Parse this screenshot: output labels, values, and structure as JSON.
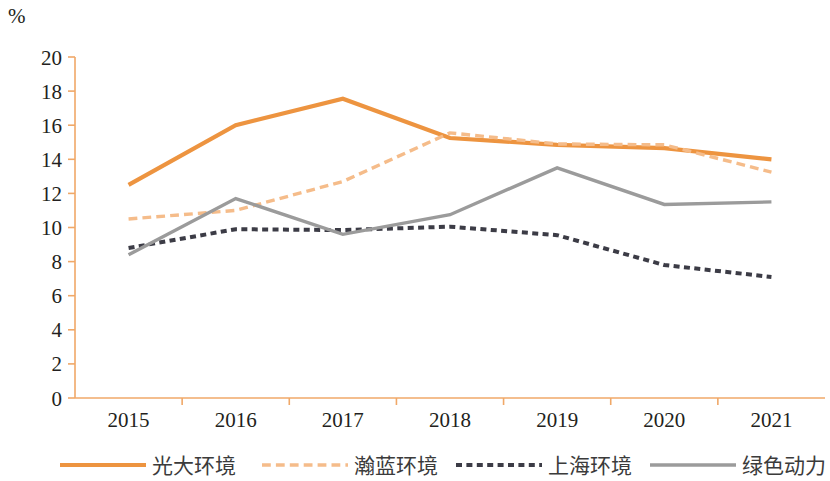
{
  "chart_data": {
    "type": "line",
    "title": "",
    "unit_label": "%",
    "xlabel": "",
    "ylabel": "%",
    "x": [
      "2015",
      "2016",
      "2017",
      "2018",
      "2019",
      "2020",
      "2021"
    ],
    "categories": [
      "2015",
      "2016",
      "2017",
      "2018",
      "2019",
      "2020",
      "2021"
    ],
    "ylim": [
      0,
      20
    ],
    "ytick_step": 2,
    "yticks": [
      "0",
      "2",
      "4",
      "6",
      "8",
      "10",
      "12",
      "14",
      "16",
      "18",
      "20"
    ],
    "grid": false,
    "legend_position": "bottom",
    "series": [
      {
        "name": "光大环境",
        "style": "solid",
        "color": "#ED9440",
        "width": 4.2,
        "values": [
          12.5,
          16.0,
          17.55,
          15.25,
          14.85,
          14.65,
          14.0
        ]
      },
      {
        "name": "瀚蓝环境",
        "style": "dashed",
        "color": "#F5BC8A",
        "width": 3.4,
        "values": [
          10.5,
          11.0,
          12.7,
          15.55,
          14.9,
          14.85,
          13.25
        ]
      },
      {
        "name": "上海环境",
        "style": "dotted",
        "color": "#3C3C46",
        "width": 4.0,
        "values": [
          8.8,
          9.9,
          9.85,
          10.05,
          9.55,
          7.8,
          7.1
        ]
      },
      {
        "name": "绿色动力",
        "style": "solid",
        "color": "#9B9B9B",
        "width": 3.4,
        "values": [
          8.4,
          11.7,
          9.6,
          10.75,
          13.5,
          11.35,
          11.5
        ]
      }
    ]
  },
  "axis": {
    "color": "#f0a868"
  },
  "legend": {
    "items": [
      {
        "label": "光大环境"
      },
      {
        "label": "瀚蓝环境"
      },
      {
        "label": "上海环境"
      },
      {
        "label": "绿色动力"
      }
    ]
  }
}
